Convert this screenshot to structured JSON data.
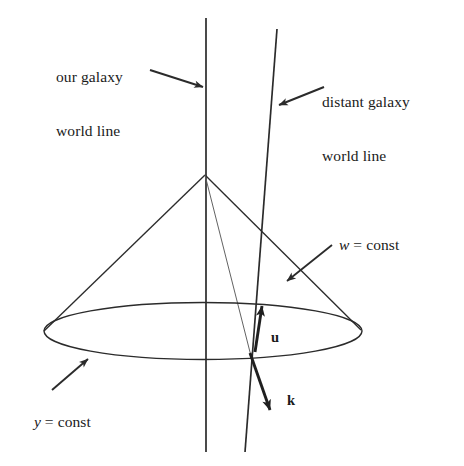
{
  "figure": {
    "background_color": "#ffffff",
    "line_color": "#2b2b2b",
    "text_color": "#1a1a1a",
    "width": 464,
    "height": 466
  },
  "labels": {
    "our_galaxy": {
      "line1": "our galaxy",
      "line2": "world line"
    },
    "distant_galaxy": {
      "line1": "distant galaxy",
      "line2": "world line"
    },
    "w_const": {
      "variable": "w",
      "rest": " = const"
    },
    "y_const": {
      "variable": "y",
      "rest": " = const"
    },
    "vector_u": "u",
    "vector_k": "k"
  },
  "elements": {
    "our_galaxy_world_line": "vertical-line",
    "distant_galaxy_world_line": "tilted-line",
    "light_cone": "cone-with-elliptical-base",
    "cone_base_ellipse": "ellipse",
    "apex_ray": "thin-line-apex-to-intersection",
    "u_arrow": "upward-arrow",
    "k_arrow": "downward-right-arrow",
    "our_galaxy_pointer": "arrow",
    "distant_galaxy_pointer": "arrow",
    "w_const_pointer": "arrow",
    "y_const_pointer": "arrow"
  }
}
